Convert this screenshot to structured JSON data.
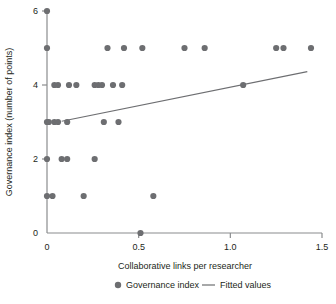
{
  "chart_data": {
    "type": "scatter",
    "title": "",
    "xlabel": "Collaborative links per researcher",
    "ylabel": "Governance index (number of points)",
    "xlim": [
      0,
      1.5
    ],
    "ylim": [
      0,
      6
    ],
    "xticks": [
      "0",
      "0.5",
      "1.0",
      "1.5"
    ],
    "xtick_values": [
      0,
      0.5,
      1.0,
      1.5
    ],
    "yticks": [
      "0",
      "2",
      "4",
      "6"
    ],
    "ytick_values": [
      0,
      2,
      4,
      6
    ],
    "grid": false,
    "legend_position": "bottom",
    "series": [
      {
        "name": "Governance index",
        "type": "scatter",
        "marker": "circle",
        "color": "#6d6e71",
        "points": [
          [
            0.0,
            6
          ],
          [
            0.0,
            5
          ],
          [
            0.33,
            5
          ],
          [
            0.42,
            5
          ],
          [
            0.52,
            5
          ],
          [
            0.75,
            5
          ],
          [
            0.86,
            5
          ],
          [
            1.25,
            5
          ],
          [
            1.29,
            5
          ],
          [
            1.44,
            5
          ],
          [
            0.04,
            4
          ],
          [
            0.06,
            4
          ],
          [
            0.12,
            4
          ],
          [
            0.16,
            4
          ],
          [
            0.26,
            4
          ],
          [
            0.28,
            4
          ],
          [
            0.3,
            4
          ],
          [
            0.36,
            4
          ],
          [
            0.41,
            4
          ],
          [
            1.07,
            4
          ],
          [
            0.0,
            3
          ],
          [
            0.01,
            3
          ],
          [
            0.04,
            3
          ],
          [
            0.06,
            3
          ],
          [
            0.11,
            3
          ],
          [
            0.31,
            3
          ],
          [
            0.39,
            3
          ],
          [
            0.0,
            2
          ],
          [
            0.08,
            2
          ],
          [
            0.11,
            2
          ],
          [
            0.26,
            2
          ],
          [
            0.0,
            1
          ],
          [
            0.03,
            1
          ],
          [
            0.2,
            1
          ],
          [
            0.58,
            1
          ],
          [
            0.51,
            0
          ]
        ]
      },
      {
        "name": "Fitted values",
        "type": "line",
        "color": "#6d6e71",
        "endpoints": [
          [
            0.08,
            3.02
          ],
          [
            1.42,
            4.36
          ]
        ]
      }
    ]
  },
  "legend": {
    "items": [
      {
        "label": "Governance index",
        "marker": "dot",
        "color": "#6d6e71"
      },
      {
        "label": "Fitted values",
        "marker": "line",
        "color": "#6d6e71"
      }
    ]
  },
  "axes": {
    "x_title": "Collaborative links per researcher",
    "y_title": "Governance index (number of points)",
    "x_tick_labels": [
      "0",
      "0.5",
      "1.0",
      "1.5"
    ],
    "y_tick_labels": [
      "0",
      "2",
      "4",
      "6"
    ]
  },
  "colors": {
    "marker": "#6d6e71",
    "line": "#6d6e71",
    "axis": "#8a8c8e",
    "text": "#231f20",
    "background": "#ffffff"
  }
}
